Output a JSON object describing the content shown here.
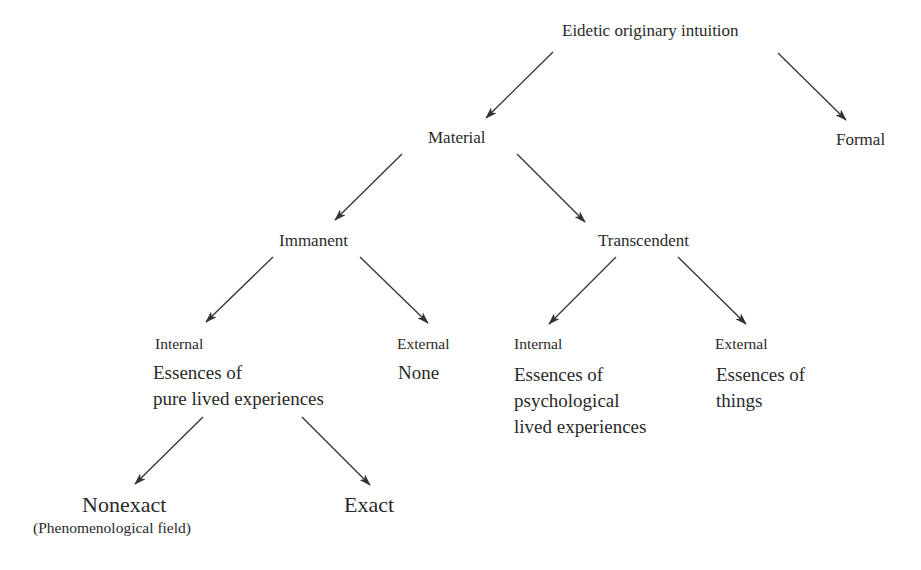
{
  "diagram": {
    "type": "tree",
    "text_color": "#2a2a2a",
    "arrow_color": "#333333",
    "nodes": {
      "root": {
        "label": "Eidetic originary intuition"
      },
      "material": {
        "label": "Material"
      },
      "formal": {
        "label": "Formal"
      },
      "immanent": {
        "label": "Immanent"
      },
      "transcendent": {
        "label": "Transcendent"
      },
      "imm_internal": {
        "label": "Internal",
        "description": "Essences of\npure lived experiences"
      },
      "imm_external": {
        "label": "External",
        "description": "None"
      },
      "tr_internal": {
        "label": "Internal",
        "description": "Essences of\npsychological\nlived experiences"
      },
      "tr_external": {
        "label": "External",
        "description": "Essences of\nthings"
      },
      "nonexact": {
        "label": "Nonexact",
        "sublabel": "(Phenomenological field)"
      },
      "exact": {
        "label": "Exact"
      }
    },
    "edges": [
      {
        "from": "root",
        "to": "material",
        "x1": 553,
        "y1": 52,
        "x2": 486,
        "y2": 118
      },
      {
        "from": "root",
        "to": "formal",
        "x1": 778,
        "y1": 53,
        "x2": 846,
        "y2": 120
      },
      {
        "from": "material",
        "to": "immanent",
        "x1": 402,
        "y1": 154,
        "x2": 335,
        "y2": 220
      },
      {
        "from": "material",
        "to": "transcendent",
        "x1": 517,
        "y1": 154,
        "x2": 585,
        "y2": 222
      },
      {
        "from": "immanent",
        "to": "imm_internal",
        "x1": 273,
        "y1": 257,
        "x2": 206,
        "y2": 322
      },
      {
        "from": "immanent",
        "to": "imm_external",
        "x1": 360,
        "y1": 257,
        "x2": 428,
        "y2": 323
      },
      {
        "from": "transcendent",
        "to": "tr_internal",
        "x1": 616,
        "y1": 257,
        "x2": 549,
        "y2": 324
      },
      {
        "from": "transcendent",
        "to": "tr_external",
        "x1": 678,
        "y1": 257,
        "x2": 746,
        "y2": 324
      },
      {
        "from": "imm_internal",
        "to": "nonexact",
        "x1": 203,
        "y1": 417,
        "x2": 135,
        "y2": 484
      },
      {
        "from": "imm_internal",
        "to": "exact",
        "x1": 302,
        "y1": 417,
        "x2": 370,
        "y2": 485
      }
    ]
  }
}
